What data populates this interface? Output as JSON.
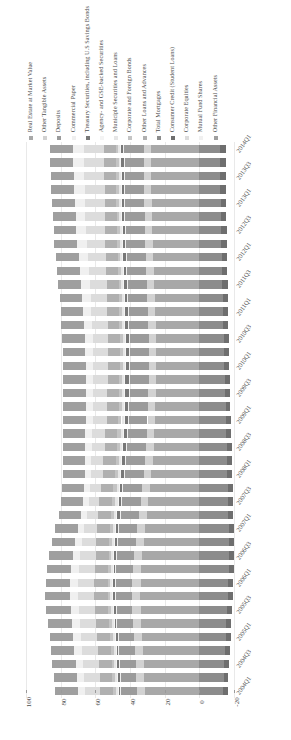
{
  "chart_data": {
    "type": "bar",
    "orientation": "horizontal-stacked",
    "title": "",
    "subtitle": "",
    "xlabel": "",
    "ylabel": "",
    "xlim": [
      -20,
      100
    ],
    "x_reversed": true,
    "xticks": [
      "100",
      "80",
      "60",
      "40",
      "20",
      "0",
      "-20"
    ],
    "xtick_values": [
      100,
      80,
      60,
      40,
      20,
      0,
      -20
    ],
    "grid": true,
    "grid_axis": "x",
    "legend_position": "top",
    "legend_orientation": "vertical-rotated",
    "series": [
      {
        "name": "Real Estate at Market Value",
        "color": "#a8a8a8",
        "values": [
          31.5,
          31.8,
          32.2,
          32.5,
          32.9,
          33.4,
          33.8,
          34.1,
          33.9,
          33.5,
          32.8,
          32.0,
          31.1,
          30.2,
          29.4,
          28.5,
          27.6,
          27.0,
          26.4,
          26.0,
          25.6,
          25.3,
          25.1,
          25.0,
          24.9,
          24.9,
          25.0,
          25.2,
          25.4,
          25.7,
          26.0,
          26.3,
          26.6,
          26.9,
          27.1,
          27.3,
          27.5,
          27.6,
          27.7,
          27.8,
          27.9
        ]
      },
      {
        "name": "Other Tangible Assets",
        "color": "#d2d2d2",
        "values": [
          4.6,
          4.6,
          4.6,
          4.7,
          4.7,
          4.7,
          4.8,
          4.8,
          4.8,
          4.8,
          4.7,
          4.7,
          4.6,
          4.6,
          4.5,
          4.5,
          4.4,
          4.4,
          4.3,
          4.3,
          4.3,
          4.3,
          4.3,
          4.3,
          4.3,
          4.3,
          4.3,
          4.3,
          4.3,
          4.3,
          4.3,
          4.3,
          4.3,
          4.3,
          4.3,
          4.3,
          4.3,
          4.3,
          4.3,
          4.3,
          4.3
        ]
      },
      {
        "name": "Deposits",
        "color": "#9b9b9b",
        "values": [
          9.2,
          9.2,
          9.3,
          9.3,
          9.3,
          9.4,
          9.4,
          9.5,
          9.6,
          9.8,
          10.1,
          10.4,
          10.8,
          11.0,
          11.1,
          11.2,
          11.2,
          11.2,
          11.2,
          11.2,
          11.2,
          11.2,
          11.2,
          11.2,
          11.2,
          11.2,
          11.2,
          11.3,
          11.3,
          11.3,
          11.3,
          11.4,
          11.4,
          11.4,
          11.4,
          11.4,
          11.4,
          11.4,
          11.4,
          11.4,
          11.4
        ]
      },
      {
        "name": "Commercial Paper",
        "color": "#efefef",
        "values": [
          0.3,
          0.3,
          0.3,
          0.3,
          0.3,
          0.3,
          0.3,
          0.3,
          0.3,
          0.3,
          0.3,
          0.3,
          0.3,
          0.2,
          0.2,
          0.2,
          0.2,
          0.2,
          0.2,
          0.2,
          0.2,
          0.2,
          0.2,
          0.2,
          0.2,
          0.2,
          0.2,
          0.2,
          0.2,
          0.2,
          0.2,
          0.2,
          0.2,
          0.2,
          0.2,
          0.2,
          0.2,
          0.2,
          0.2,
          0.2,
          0.2
        ]
      },
      {
        "name": "Treasury Securities, including U.S Savings Bonds",
        "color": "#787878",
        "values": [
          0.9,
          0.9,
          0.9,
          0.9,
          0.9,
          0.9,
          0.9,
          0.9,
          1.0,
          1.0,
          1.1,
          1.2,
          1.3,
          1.4,
          1.5,
          1.6,
          1.7,
          1.8,
          1.9,
          2.0,
          2.0,
          2.1,
          2.1,
          2.1,
          2.0,
          2.0,
          1.9,
          1.9,
          1.8,
          1.8,
          1.7,
          1.7,
          1.6,
          1.6,
          1.5,
          1.5,
          1.5,
          1.4,
          1.4,
          1.4,
          1.4
        ]
      },
      {
        "name": "Agency- and GSE-backed Securities",
        "color": "#f4f4f4",
        "values": [
          0.6,
          0.6,
          0.6,
          0.6,
          0.6,
          0.6,
          0.6,
          0.6,
          0.6,
          0.6,
          0.6,
          0.6,
          0.6,
          0.5,
          0.5,
          0.5,
          0.5,
          0.5,
          0.5,
          0.5,
          0.4,
          0.4,
          0.4,
          0.4,
          0.4,
          0.4,
          0.4,
          0.4,
          0.4,
          0.4,
          0.4,
          0.4,
          0.4,
          0.4,
          0.4,
          0.4,
          0.4,
          0.4,
          0.4,
          0.4,
          0.4
        ]
      },
      {
        "name": "Municiple Securities and Loans",
        "color": "#e6e6e6",
        "values": [
          1.2,
          1.2,
          1.2,
          1.2,
          1.2,
          1.2,
          1.2,
          1.2,
          1.2,
          1.2,
          1.2,
          1.2,
          1.2,
          1.2,
          1.2,
          1.2,
          1.2,
          1.2,
          1.2,
          1.2,
          1.2,
          1.2,
          1.2,
          1.2,
          1.2,
          1.2,
          1.2,
          1.2,
          1.2,
          1.1,
          1.1,
          1.1,
          1.1,
          1.1,
          1.1,
          1.1,
          1.1,
          1.1,
          1.1,
          1.1,
          1.1
        ]
      },
      {
        "name": "Corporate and Foreign Bonds",
        "color": "#c4c4c4",
        "values": [
          1.5,
          1.5,
          1.5,
          1.5,
          1.5,
          1.5,
          1.5,
          1.5,
          1.5,
          1.6,
          1.6,
          1.7,
          1.8,
          1.9,
          2.0,
          2.0,
          2.0,
          2.0,
          1.9,
          1.9,
          1.8,
          1.8,
          1.8,
          1.7,
          1.7,
          1.7,
          1.6,
          1.6,
          1.6,
          1.6,
          1.6,
          1.6,
          1.5,
          1.5,
          1.5,
          1.5,
          1.5,
          1.5,
          1.5,
          1.5,
          1.5
        ]
      },
      {
        "name": "Other Loans and Advances",
        "color": "#b0b0b0",
        "values": [
          7.4,
          7.4,
          7.4,
          7.5,
          7.5,
          7.5,
          7.6,
          7.6,
          7.6,
          7.6,
          7.5,
          7.5,
          7.4,
          7.3,
          7.2,
          7.1,
          7.0,
          7.0,
          6.9,
          6.9,
          6.8,
          6.8,
          6.8,
          6.8,
          6.8,
          6.8,
          6.8,
          6.8,
          6.8,
          6.8,
          6.8,
          6.8,
          6.8,
          6.8,
          6.8,
          6.8,
          6.8,
          6.8,
          6.8,
          6.8,
          6.8
        ]
      },
      {
        "name": "Total Mortgages",
        "color": "#8c8c8c",
        "values": [
          -13.8,
          -14.1,
          -14.4,
          -14.8,
          -15.2,
          -15.6,
          -16.0,
          -16.4,
          -16.7,
          -16.9,
          -17.0,
          -17.0,
          -16.9,
          -16.8,
          -16.6,
          -16.4,
          -16.2,
          -16.0,
          -15.8,
          -15.5,
          -15.3,
          -15.1,
          -14.9,
          -14.7,
          -14.5,
          -14.3,
          -14.1,
          -13.9,
          -13.7,
          -13.5,
          -13.3,
          -13.1,
          -12.9,
          -12.7,
          -12.6,
          -12.4,
          -12.3,
          -12.2,
          -12.1,
          -12.0,
          -11.9
        ]
      },
      {
        "name": "Consumer Credit (Student Loans)",
        "color": "#6e6e6e",
        "values": [
          -2.6,
          -2.6,
          -2.7,
          -2.7,
          -2.8,
          -2.8,
          -2.8,
          -2.9,
          -2.9,
          -2.9,
          -2.9,
          -2.9,
          -2.9,
          -2.9,
          -2.8,
          -2.8,
          -2.8,
          -2.8,
          -2.8,
          -2.8,
          -2.8,
          -2.8,
          -2.8,
          -2.8,
          -2.9,
          -2.9,
          -2.9,
          -2.9,
          -3.0,
          -3.0,
          -3.0,
          -3.1,
          -3.1,
          -3.1,
          -3.2,
          -3.2,
          -3.2,
          -3.3,
          -3.3,
          -3.3,
          -3.3
        ]
      },
      {
        "name": "Corporate Equities",
        "color": "#dcdcdc",
        "values": [
          8.6,
          8.8,
          9.0,
          9.2,
          9.3,
          9.5,
          9.6,
          9.7,
          9.6,
          9.3,
          8.8,
          8.1,
          7.2,
          6.6,
          6.3,
          6.4,
          6.8,
          7.2,
          7.6,
          7.9,
          8.1,
          8.3,
          8.4,
          8.5,
          8.6,
          8.7,
          8.9,
          9.1,
          9.3,
          9.5,
          9.8,
          10.1,
          10.4,
          10.7,
          11.0,
          11.2,
          11.4,
          11.5,
          11.6,
          11.7,
          11.8
        ]
      },
      {
        "name": "Mutual Fund Shares",
        "color": "#f0f0f0",
        "values": [
          4.2,
          4.3,
          4.3,
          4.4,
          4.4,
          4.5,
          4.5,
          4.6,
          4.5,
          4.4,
          4.2,
          3.9,
          3.5,
          3.2,
          3.1,
          3.1,
          3.3,
          3.5,
          3.7,
          3.8,
          3.9,
          4.0,
          4.1,
          4.2,
          4.3,
          4.4,
          4.5,
          4.6,
          4.7,
          4.8,
          5.0,
          5.2,
          5.3,
          5.5,
          5.6,
          5.7,
          5.8,
          5.9,
          6.0,
          6.0,
          6.1
        ]
      },
      {
        "name": "Other Financial Assets",
        "color": "#9f9f9f",
        "values": [
          13.4,
          13.5,
          13.6,
          13.7,
          13.8,
          13.9,
          14.0,
          14.1,
          14.1,
          14.0,
          13.8,
          13.6,
          13.3,
          13.1,
          13.0,
          12.9,
          12.9,
          12.9,
          12.9,
          12.9,
          12.9,
          12.9,
          12.9,
          12.9,
          12.9,
          12.9,
          13.0,
          13.0,
          13.0,
          13.1,
          13.1,
          13.1,
          13.2,
          13.2,
          13.2,
          13.2,
          13.3,
          13.3,
          13.3,
          13.3,
          13.3
        ]
      }
    ],
    "categories": [
      "2004Q1",
      "2004Q2",
      "2004Q3",
      "2004Q4",
      "2005Q1",
      "2005Q2",
      "2005Q3",
      "2005Q4",
      "2006Q1",
      "2006Q2",
      "2006Q3",
      "2006Q4",
      "2007Q1",
      "2007Q2",
      "2007Q3",
      "2007Q4",
      "2008Q1",
      "2008Q2",
      "2008Q3",
      "2008Q4",
      "2009Q1",
      "2009Q2",
      "2009Q3",
      "2009Q4",
      "2010Q1",
      "2010Q2",
      "2010Q3",
      "2010Q4",
      "2011Q1",
      "2011Q2",
      "2011Q3",
      "2011Q4",
      "2012Q1",
      "2012Q2",
      "2012Q3",
      "2012Q4",
      "2013Q1",
      "2013Q2",
      "2013Q3",
      "2013Q4",
      "2014Q1"
    ],
    "ytick_labels": [
      "2014Q1",
      "2013Q3",
      "2013Q1",
      "2012Q3",
      "2012Q1",
      "2011Q3",
      "2011Q1",
      "2010Q3",
      "2010Q1",
      "2009Q3",
      "2009Q1",
      "2008Q3",
      "2008Q1",
      "2007Q3",
      "2007Q1",
      "2006Q3",
      "2006Q1",
      "2005Q3",
      "2005Q1",
      "2004Q3",
      "2004Q1"
    ]
  }
}
